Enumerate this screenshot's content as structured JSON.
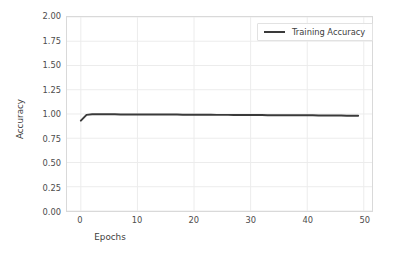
{
  "chart_data": {
    "type": "line",
    "title": "",
    "xlabel": "Epochs",
    "ylabel": "Accuracy",
    "xlim": [
      -2.45,
      51.45
    ],
    "ylim": [
      0.0,
      2.0
    ],
    "xticks": [
      0,
      10,
      20,
      30,
      40,
      50
    ],
    "xtick_labels": [
      "0",
      "10",
      "20",
      "30",
      "40",
      "50"
    ],
    "yticks": [
      0.0,
      0.25,
      0.5,
      0.75,
      1.0,
      1.25,
      1.5,
      1.75,
      2.0
    ],
    "ytick_labels": [
      "0.00",
      "0.25",
      "0.50",
      "0.75",
      "1.00",
      "1.25",
      "1.50",
      "1.75",
      "2.00"
    ],
    "grid": true,
    "grid_color": "#ececec",
    "legend_position": "upper right",
    "series": [
      {
        "name": "Training Accuracy",
        "color": "#3a3a3a",
        "linewidth": 2.0,
        "x": [
          0,
          1,
          2,
          3,
          4,
          5,
          6,
          7,
          8,
          9,
          10,
          11,
          12,
          13,
          14,
          15,
          16,
          17,
          18,
          19,
          20,
          21,
          22,
          23,
          24,
          25,
          26,
          27,
          28,
          29,
          30,
          31,
          32,
          33,
          34,
          35,
          36,
          37,
          38,
          39,
          40,
          41,
          42,
          43,
          44,
          45,
          46,
          47,
          48,
          49
        ],
        "values": [
          0.932,
          0.991,
          0.997,
          0.997,
          0.997,
          0.997,
          0.997,
          0.996,
          0.996,
          0.996,
          0.996,
          0.995,
          0.995,
          0.995,
          0.995,
          0.994,
          0.994,
          0.994,
          0.993,
          0.993,
          0.993,
          0.992,
          0.992,
          0.992,
          0.991,
          0.991,
          0.991,
          0.99,
          0.99,
          0.99,
          0.989,
          0.989,
          0.989,
          0.988,
          0.988,
          0.988,
          0.987,
          0.987,
          0.987,
          0.986,
          0.986,
          0.986,
          0.985,
          0.985,
          0.984,
          0.984,
          0.984,
          0.983,
          0.983,
          0.982
        ]
      }
    ]
  },
  "legend": {
    "entries": [
      {
        "label": "Training Accuracy"
      }
    ]
  },
  "axes": {
    "x_title": "Epochs",
    "y_title": "Accuracy"
  }
}
